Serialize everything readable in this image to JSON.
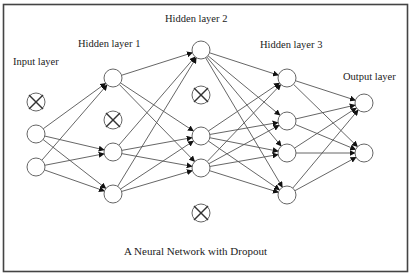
{
  "diagram": {
    "title": "A Neural Network with Dropout",
    "colors": {
      "stroke": "#555555",
      "arrow": "#111111",
      "frame": "#444444",
      "text": "#222222"
    },
    "node_radius": 9,
    "layers": [
      {
        "id": "input",
        "label": "Input layer",
        "label_pos": [
          13,
          65
        ],
        "x": 36,
        "nodes": [
          {
            "y": 102,
            "dropped": true
          },
          {
            "y": 134,
            "dropped": false
          },
          {
            "y": 167,
            "dropped": false
          }
        ]
      },
      {
        "id": "hidden1",
        "label": "Hidden layer 1",
        "label_pos": [
          78,
          47
        ],
        "x": 113,
        "nodes": [
          {
            "y": 78,
            "dropped": false
          },
          {
            "y": 120,
            "dropped": true
          },
          {
            "y": 152,
            "dropped": false
          },
          {
            "y": 194,
            "dropped": false
          }
        ]
      },
      {
        "id": "hidden2",
        "label": "Hidden layer 2",
        "label_pos": [
          165,
          22
        ],
        "x": 201,
        "nodes": [
          {
            "y": 50,
            "dropped": false
          },
          {
            "y": 95,
            "dropped": true
          },
          {
            "y": 136,
            "dropped": false
          },
          {
            "y": 168,
            "dropped": false
          },
          {
            "y": 213,
            "dropped": true
          }
        ]
      },
      {
        "id": "hidden3",
        "label": "Hidden layer 3",
        "label_pos": [
          260,
          48
        ],
        "x": 287,
        "nodes": [
          {
            "y": 78,
            "dropped": false
          },
          {
            "y": 121,
            "dropped": false
          },
          {
            "y": 153,
            "dropped": false
          },
          {
            "y": 195,
            "dropped": false
          }
        ]
      },
      {
        "id": "output",
        "label": "Output layer",
        "label_pos": [
          343,
          80
        ],
        "x": 364,
        "nodes": [
          {
            "y": 103,
            "dropped": false
          },
          {
            "y": 153,
            "dropped": false
          }
        ]
      }
    ],
    "caption_pos": [
      124,
      255
    ]
  }
}
